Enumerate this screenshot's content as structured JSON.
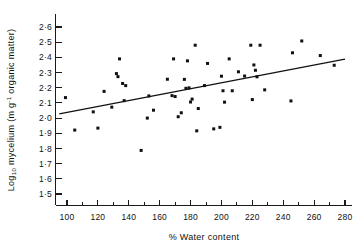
{
  "chart_data": {
    "type": "scatter",
    "title": "",
    "xlabel": "% Water content",
    "ylabel": "Log10 mycelium (m g-1 organic matter)",
    "ylabel_parts": {
      "prefix": "Log",
      "subscript": "10",
      "mid": " mycelium (m g",
      "superscript": "-1",
      "suffix": " organic matter)"
    },
    "xlim": [
      93,
      281
    ],
    "ylim": [
      1.44,
      2.66
    ],
    "x_ticks": [
      100,
      120,
      140,
      160,
      180,
      200,
      220,
      240,
      260,
      280
    ],
    "x_tick_labels": [
      "100",
      "120",
      "140",
      "160",
      "180",
      "200",
      "220",
      "240",
      "260",
      "280"
    ],
    "x_minor_ticks": [
      110,
      130,
      150,
      170,
      190,
      210,
      230,
      250,
      270
    ],
    "y_ticks": [
      1.5,
      1.6,
      1.7,
      1.8,
      1.9,
      2.0,
      2.1,
      2.2,
      2.3,
      2.4,
      2.5,
      2.6
    ],
    "y_tick_labels": [
      "1·5",
      "1·6",
      "1·7",
      "1·8",
      "1·9",
      "2·0",
      "2·1",
      "2·2",
      "2·3",
      "2·4",
      "2·5",
      "2·6"
    ],
    "grid": false,
    "legend": null,
    "marker": "filled-square",
    "marker_color": "#101010",
    "trendline": {
      "type": "linear-regression",
      "x_start": 95,
      "y_start": 2.028,
      "x_end": 280,
      "y_end": 2.388,
      "color": "#111111"
    },
    "points": [
      [
        99,
        2.135
      ],
      [
        105,
        1.921
      ],
      [
        117,
        2.041
      ],
      [
        120,
        1.934
      ],
      [
        124,
        2.176
      ],
      [
        129,
        2.072
      ],
      [
        132,
        2.293
      ],
      [
        133,
        2.273
      ],
      [
        134,
        2.39
      ],
      [
        136,
        2.228
      ],
      [
        137,
        2.115
      ],
      [
        138,
        2.214
      ],
      [
        148,
        1.787
      ],
      [
        152,
        2.0
      ],
      [
        153,
        2.146
      ],
      [
        156,
        2.052
      ],
      [
        165,
        2.256
      ],
      [
        168,
        2.148
      ],
      [
        169,
        2.39
      ],
      [
        170,
        2.142
      ],
      [
        172,
        2.009
      ],
      [
        174,
        2.035
      ],
      [
        176,
        2.255
      ],
      [
        177,
        2.196
      ],
      [
        178,
        2.377
      ],
      [
        179,
        2.199
      ],
      [
        180,
        2.106
      ],
      [
        181,
        2.125
      ],
      [
        183,
        2.48
      ],
      [
        184,
        1.916
      ],
      [
        185,
        2.063
      ],
      [
        189,
        2.214
      ],
      [
        191,
        2.36
      ],
      [
        195,
        1.929
      ],
      [
        199,
        1.939
      ],
      [
        200,
        2.276
      ],
      [
        201,
        2.18
      ],
      [
        202,
        2.105
      ],
      [
        205,
        2.39
      ],
      [
        207,
        2.18
      ],
      [
        211,
        2.305
      ],
      [
        215,
        2.277
      ],
      [
        219,
        2.48
      ],
      [
        220,
        2.122
      ],
      [
        221,
        2.35
      ],
      [
        222,
        2.315
      ],
      [
        223,
        2.272
      ],
      [
        225,
        2.48
      ],
      [
        228,
        2.186
      ],
      [
        245,
        2.113
      ],
      [
        246,
        2.43
      ],
      [
        252,
        2.508
      ],
      [
        264,
        2.412
      ],
      [
        273,
        2.348
      ]
    ]
  }
}
